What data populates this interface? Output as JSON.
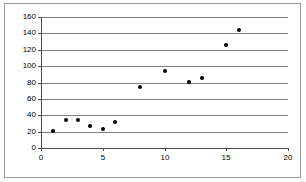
{
  "chart_data": {
    "type": "scatter",
    "title": "",
    "xlabel": "",
    "ylabel": "",
    "xlim": [
      0,
      20
    ],
    "ylim": [
      0,
      160
    ],
    "xticks": [
      0,
      5,
      10,
      15,
      20
    ],
    "yticks": [
      0,
      20,
      40,
      60,
      80,
      100,
      120,
      140,
      160
    ],
    "gridlines": "horizontal",
    "legend": "none",
    "marker": "filled-circle",
    "marker_color": "#000000",
    "x": [
      1,
      2,
      3,
      4,
      5,
      6,
      8,
      10,
      12,
      13,
      15,
      16
    ],
    "y": [
      21,
      34,
      34,
      27,
      23,
      32,
      74,
      94,
      81,
      86,
      126,
      144
    ],
    "points": [
      {
        "x": 1,
        "y": 21
      },
      {
        "x": 2,
        "y": 34
      },
      {
        "x": 3,
        "y": 34
      },
      {
        "x": 4,
        "y": 27
      },
      {
        "x": 5,
        "y": 23
      },
      {
        "x": 6,
        "y": 32
      },
      {
        "x": 8,
        "y": 74
      },
      {
        "x": 10,
        "y": 94
      },
      {
        "x": 12,
        "y": 81
      },
      {
        "x": 13,
        "y": 86
      },
      {
        "x": 15,
        "y": 126
      },
      {
        "x": 16,
        "y": 144
      }
    ]
  },
  "axis": {
    "y_tick_labels": [
      "0",
      "20",
      "40",
      "60",
      "80",
      "100",
      "120",
      "140",
      "160"
    ],
    "x_tick_labels": [
      "0",
      "5",
      "10",
      "15",
      "20"
    ]
  },
  "colors": {
    "grid": "#808080",
    "axis": "#4d4d4d",
    "frame": "#9a9a9a",
    "marker": "#000000",
    "background": "#ffffff"
  }
}
